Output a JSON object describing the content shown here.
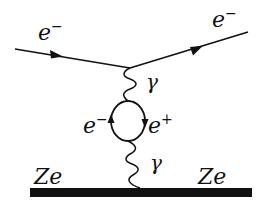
{
  "diagram": {
    "type": "feynman-diagram",
    "labels": {
      "incoming_electron": {
        "base": "e",
        "sup": "−"
      },
      "outgoing_electron": {
        "base": "e",
        "sup": "−"
      },
      "photon_top": "γ",
      "photon_bottom": "γ",
      "loop_electron": {
        "base": "e",
        "sup": "−"
      },
      "loop_positron": {
        "base": "e",
        "sup": "+"
      },
      "nucleus_left": "Ze",
      "nucleus_right": "Ze"
    },
    "colors": {
      "line": "#111111",
      "background": "#ffffff"
    }
  }
}
